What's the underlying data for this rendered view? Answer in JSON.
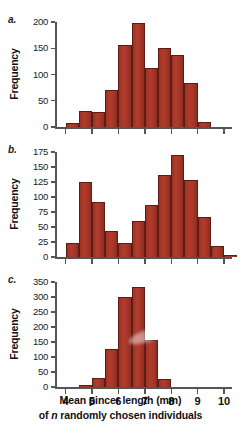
{
  "figure": {
    "ylabel": "Frequency",
    "xlabel_line1": "Mean pincer length (mm)",
    "xlabel_line2_pre": "of ",
    "xlabel_line2_italic": "n",
    "xlabel_line2_post": " randomly chosen individuals",
    "bar_color": "#a5362a",
    "bar_edge_color": "#5e1d14",
    "axis_color": "#555555",
    "background": "#ffffff"
  },
  "panels": [
    {
      "label": "a.",
      "ylabel": "Frequency",
      "yticks": [
        0,
        50,
        100,
        150,
        200
      ],
      "ylim": [
        0,
        200
      ],
      "xticks": [
        4,
        5,
        6,
        7,
        8,
        9,
        10
      ],
      "xlim": [
        3.6,
        10.3
      ],
      "show_xtick_labels": false,
      "bin_width": 0.5,
      "bin_starts": [
        4.0,
        4.5,
        5.0,
        5.5,
        6.0,
        6.5,
        7.0,
        7.5,
        8.0,
        8.5
      ],
      "values": [
        7,
        31,
        29,
        70,
        157,
        199,
        112,
        151,
        138,
        83
      ],
      "extra_bins": [
        {
          "start": 9.0,
          "value": 10
        }
      ]
    },
    {
      "label": "b.",
      "ylabel": "Frequency",
      "yticks": [
        0,
        25,
        50,
        75,
        100,
        125,
        150,
        175
      ],
      "ylim": [
        0,
        175
      ],
      "xticks": [
        4,
        5,
        6,
        7,
        8,
        9,
        10
      ],
      "xlim": [
        3.6,
        10.3
      ],
      "show_xtick_labels": false,
      "bin_width": 0.5,
      "bin_starts": [
        4.0,
        4.5,
        5.0,
        5.5,
        6.0,
        6.5,
        7.0,
        7.5,
        8.0,
        8.5,
        9.0
      ],
      "values": [
        23,
        125,
        92,
        44,
        23,
        60,
        87,
        136,
        170,
        128,
        66
      ],
      "extra_bins": [
        {
          "start": 9.5,
          "value": 18
        },
        {
          "start": 10.0,
          "value": 3
        }
      ]
    },
    {
      "label": "c.",
      "ylabel": "Frequency",
      "yticks": [
        0,
        50,
        100,
        150,
        200,
        250,
        300,
        350
      ],
      "ylim": [
        0,
        350
      ],
      "xticks": [
        4,
        5,
        6,
        7,
        8,
        9,
        10
      ],
      "xlim": [
        3.6,
        10.3
      ],
      "show_xtick_labels": true,
      "bin_width": 0.5,
      "bin_starts": [
        4.5,
        5.0,
        5.5,
        6.0,
        6.5,
        7.0,
        7.5
      ],
      "values": [
        6,
        30,
        127,
        299,
        333,
        158,
        28
      ],
      "extra_bins": []
    }
  ],
  "chart_data": {
    "type": "bar",
    "title": "",
    "subtitle": "",
    "xlabel": "Mean pincer length (mm) of n randomly chosen individuals",
    "ylabel": "Frequency",
    "grid": false,
    "legend": "none",
    "panels": [
      {
        "panel": "a.",
        "type": "bar",
        "ylim": [
          0,
          200
        ],
        "yticks": [
          0,
          50,
          100,
          150,
          200
        ],
        "xlim": [
          3.6,
          10.3
        ],
        "xticks": [
          4,
          5,
          6,
          7,
          8,
          9,
          10
        ],
        "bin_width": 0.5,
        "categories": [
          "4.0-4.5",
          "4.5-5.0",
          "5.0-5.5",
          "5.5-6.0",
          "6.0-6.5",
          "6.5-7.0",
          "7.0-7.5",
          "7.5-8.0",
          "8.0-8.5",
          "8.5-9.0",
          "9.0-9.5"
        ],
        "x": [
          4.25,
          4.75,
          5.25,
          5.75,
          6.25,
          6.75,
          7.25,
          7.75,
          8.25,
          8.75,
          9.25
        ],
        "values": [
          7,
          31,
          29,
          70,
          157,
          199,
          112,
          151,
          138,
          83,
          10
        ]
      },
      {
        "panel": "b.",
        "type": "bar",
        "ylim": [
          0,
          175
        ],
        "yticks": [
          0,
          25,
          50,
          75,
          100,
          125,
          150,
          175
        ],
        "xlim": [
          3.6,
          10.3
        ],
        "xticks": [
          4,
          5,
          6,
          7,
          8,
          9,
          10
        ],
        "bin_width": 0.5,
        "categories": [
          "4.0-4.5",
          "4.5-5.0",
          "5.0-5.5",
          "5.5-6.0",
          "6.0-6.5",
          "6.5-7.0",
          "7.0-7.5",
          "7.5-8.0",
          "8.0-8.5",
          "8.5-9.0",
          "9.0-9.5",
          "9.5-10.0",
          "10.0-10.5"
        ],
        "x": [
          4.25,
          4.75,
          5.25,
          5.75,
          6.25,
          6.75,
          7.25,
          7.75,
          8.25,
          8.75,
          9.25,
          9.75,
          10.25
        ],
        "values": [
          23,
          125,
          92,
          44,
          23,
          60,
          87,
          136,
          170,
          128,
          66,
          18,
          3
        ]
      },
      {
        "panel": "c.",
        "type": "bar",
        "ylim": [
          0,
          350
        ],
        "yticks": [
          0,
          50,
          100,
          150,
          200,
          250,
          300,
          350
        ],
        "xlim": [
          3.6,
          10.3
        ],
        "xticks": [
          4,
          5,
          6,
          7,
          8,
          9,
          10
        ],
        "bin_width": 0.5,
        "categories": [
          "4.5-5.0",
          "5.0-5.5",
          "5.5-6.0",
          "6.0-6.5",
          "6.5-7.0",
          "7.0-7.5",
          "7.5-8.0"
        ],
        "x": [
          4.75,
          5.25,
          5.75,
          6.25,
          6.75,
          7.25,
          7.75
        ],
        "values": [
          6,
          30,
          127,
          299,
          333,
          158,
          28
        ]
      }
    ]
  }
}
